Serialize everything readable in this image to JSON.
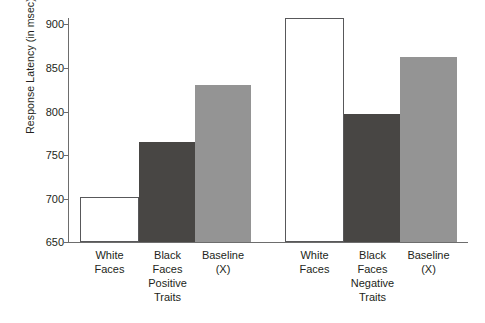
{
  "chart_data": {
    "type": "bar",
    "title": "",
    "xlabel": "",
    "ylabel": "Response Latency (in msec)",
    "ylim": [
      650,
      900
    ],
    "yticks": [
      650,
      700,
      750,
      800,
      850,
      900
    ],
    "grid": false,
    "legend": false,
    "categories": [
      "White Faces",
      "Black Faces",
      "Baseline (X)"
    ],
    "groups": [
      "Positive Traits",
      "Negative Traits"
    ],
    "series": [
      {
        "name": "Positive Traits",
        "values": [
          700,
          762,
          825
        ]
      },
      {
        "name": "Negative Traits",
        "values": [
          900,
          793,
          857
        ]
      }
    ],
    "bars": [
      {
        "group": "Positive Traits",
        "category": "White Faces",
        "value": 700,
        "style": "white"
      },
      {
        "group": "Positive Traits",
        "category": "Black Faces",
        "value": 762,
        "style": "dark"
      },
      {
        "group": "Positive Traits",
        "category": "Baseline (X)",
        "value": 825,
        "style": "mid"
      },
      {
        "group": "Negative Traits",
        "category": "White Faces",
        "value": 900,
        "style": "white"
      },
      {
        "group": "Negative Traits",
        "category": "Black Faces",
        "value": 793,
        "style": "dark"
      },
      {
        "group": "Negative Traits",
        "category": "Baseline (X)",
        "value": 857,
        "style": "mid"
      }
    ],
    "colors": {
      "white_bar_fill": "#ffffff",
      "white_bar_stroke": "#58585a",
      "dark_bar": "#484644",
      "mid_bar": "#949494",
      "axis": "#6d6d6d",
      "text": "#231f20",
      "background": "#ffffff"
    }
  },
  "axis": {
    "y_title": "Response Latency (in msec)",
    "ticks": {
      "t900": "900",
      "t850": "850",
      "t800": "800",
      "t750": "750",
      "t700": "700",
      "t650": "650"
    }
  },
  "labels": {
    "cat1_line1": "White",
    "cat1_line2": "Faces",
    "cat2_line1": "Black",
    "cat2_line2": "Faces",
    "cat3_line1": "Baseline",
    "cat3_line2": "(X)",
    "cat4_line1": "White",
    "cat4_line2": "Faces",
    "cat5_line1": "Black",
    "cat5_line2": "Faces",
    "cat6_line1": "Baseline",
    "cat6_line2": "(X)",
    "group1_line1": "Positive",
    "group1_line2": "Traits",
    "group2_line1": "Negative",
    "group2_line2": "Traits"
  }
}
